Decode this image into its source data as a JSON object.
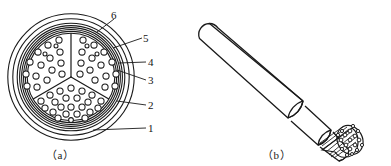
{
  "figure": {
    "stroke_color": "#1a1a1a",
    "fill_color": "#ffffff",
    "panels": [
      {
        "id": "a",
        "caption": "（a）",
        "type": "cross-section"
      },
      {
        "id": "b",
        "caption": "（b）",
        "type": "perspective-view"
      }
    ],
    "callouts": [
      {
        "id": "6",
        "label": "6",
        "target": "outer-sheath-ring"
      },
      {
        "id": "5",
        "label": "5",
        "target": "armour-layer"
      },
      {
        "id": "4",
        "label": "4",
        "target": "bedding-layer"
      },
      {
        "id": "3",
        "label": "3",
        "target": "inner-sheath"
      },
      {
        "id": "2",
        "label": "2",
        "target": "filler-layer"
      },
      {
        "id": "1",
        "label": "1",
        "target": "outer-jacket"
      }
    ],
    "cross_section": {
      "center_x": 71,
      "center_y": 77,
      "ring_radii": [
        63.5,
        58.5,
        54.0,
        51.5,
        49.5,
        47.5,
        45.5
      ],
      "core_radius": 44.0,
      "sector_count": 3,
      "conductor_radius": 3.0,
      "conductor_count": 57
    },
    "perspective": {
      "axis_start_x": 206,
      "axis_start_y": 26,
      "axis_end_x": 352,
      "axis_end_y": 118,
      "outer_radius": 19,
      "step_radii": [
        19,
        16.5,
        14,
        11.5
      ],
      "strand_count": 18
    }
  }
}
